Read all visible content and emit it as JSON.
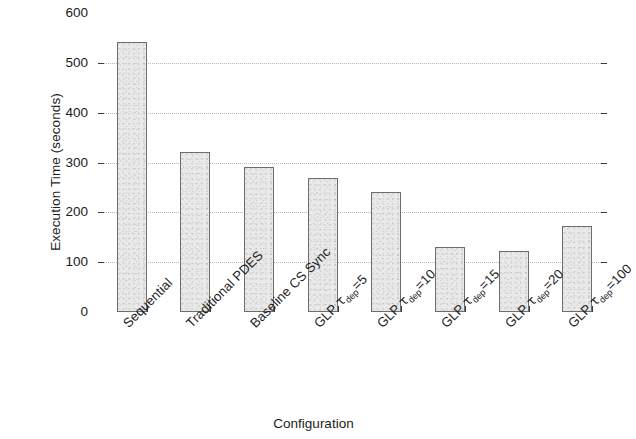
{
  "chart_data": {
    "type": "bar",
    "title": "",
    "xlabel": "Configuration",
    "ylabel": "Execution Time (seconds)",
    "categories": [
      "Sequential",
      "Traditional PDES",
      "Baseline CS Sync",
      "GLP τdep=5",
      "GLP τdep=10",
      "GLP τdep=15",
      "GLP τdep=20",
      "GLP τdep=100"
    ],
    "category_parts": [
      {
        "main": "Sequential",
        "tau": "",
        "sub": "",
        "suffix": ""
      },
      {
        "main": "Traditional PDES",
        "tau": "",
        "sub": "",
        "suffix": ""
      },
      {
        "main": "Baseline CS Sync",
        "tau": "",
        "sub": "",
        "suffix": ""
      },
      {
        "main": "GLP ",
        "tau": "τ",
        "sub": "dep",
        "suffix": "=5"
      },
      {
        "main": "GLP ",
        "tau": "τ",
        "sub": "dep",
        "suffix": "=10"
      },
      {
        "main": "GLP ",
        "tau": "τ",
        "sub": "dep",
        "suffix": "=15"
      },
      {
        "main": "GLP ",
        "tau": "τ",
        "sub": "dep",
        "suffix": "=20"
      },
      {
        "main": "GLP ",
        "tau": "τ",
        "sub": "dep",
        "suffix": "=100"
      }
    ],
    "values": [
      542,
      322,
      291,
      268,
      241,
      131,
      122,
      173
    ],
    "ylim": [
      0,
      600
    ],
    "yticks": [
      600,
      500,
      400,
      300,
      200,
      100,
      0
    ],
    "ytick_labels": [
      "600",
      "500",
      "400",
      "300",
      "200",
      "100",
      "0"
    ],
    "grid": true,
    "grid_axis": "y",
    "legend": false,
    "bar_fill": "#e9e9e9",
    "bar_edge": "#6d6d6d",
    "axis_color": "#3a3a3a",
    "grid_color": "#b9b9b9"
  }
}
